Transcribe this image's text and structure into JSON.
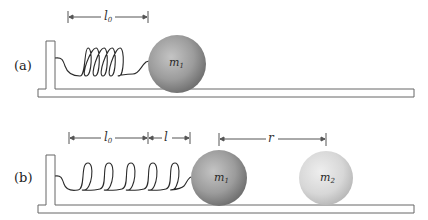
{
  "diagram": {
    "panel_a": {
      "label": "(a)",
      "dimension": {
        "symbol": "l",
        "subscript": "0"
      },
      "mass": {
        "symbol": "m",
        "subscript": "1"
      }
    },
    "panel_b": {
      "label": "(b)",
      "dimensions": [
        {
          "symbol": "l",
          "subscript": "0"
        },
        {
          "symbol": "l",
          "subscript": ""
        },
        {
          "symbol": "r",
          "subscript": ""
        }
      ],
      "masses": [
        {
          "symbol": "m",
          "subscript": "1"
        },
        {
          "symbol": "m",
          "subscript": "2"
        }
      ]
    },
    "colors": {
      "line": "#555555",
      "spring": "#2b2b2b",
      "m1_fill": "#9a9a9a",
      "m2_fill": "#d6d6d6"
    }
  }
}
